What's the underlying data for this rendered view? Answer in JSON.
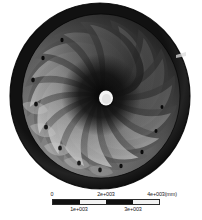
{
  "figure": {
    "component": "impeller",
    "view": "front",
    "hub_label": "",
    "blade_count": 16,
    "background_color": "#ffffff",
    "shroud_color": "#1c1c1c",
    "disc_color": "#4a4a4a",
    "blade_highlight_color": "#b9b9b9",
    "hub_color": "#f4f4f4"
  },
  "scale": {
    "unit": "mm",
    "min": 0,
    "max": 4000,
    "segment_count": 4,
    "top_ticks": [
      {
        "label": "0",
        "value": 0,
        "pos_pct": 0
      },
      {
        "label": "2e+003",
        "value": 2000,
        "pos_pct": 50
      },
      {
        "label": "4e+003(mm)",
        "value": 4000,
        "pos_pct": 100
      }
    ],
    "bottom_ticks": [
      {
        "label": "1e+003",
        "value": 1000,
        "pos_pct": 25
      },
      {
        "label": "3e+003",
        "value": 3000,
        "pos_pct": 75
      }
    ],
    "segments": [
      "dark",
      "light",
      "dark",
      "light"
    ]
  }
}
